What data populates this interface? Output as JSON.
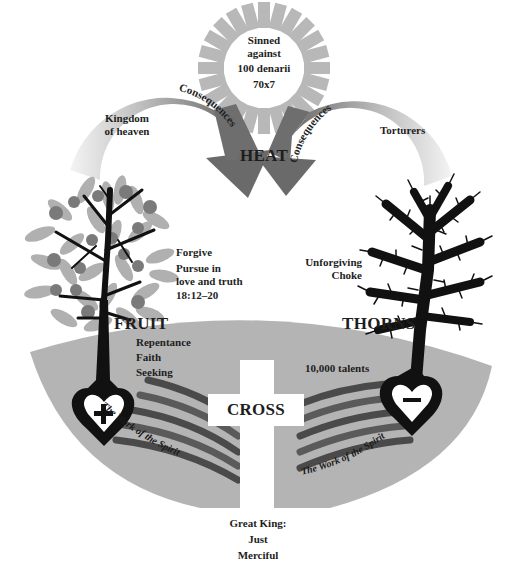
{
  "sun": {
    "lines": [
      "Sinned",
      "against",
      "100 denarii",
      "70x7"
    ],
    "label": "HEAT"
  },
  "left_arrow": {
    "curve_text": "Consequences",
    "inner_lines": [
      "Kingdom",
      "of heaven"
    ]
  },
  "right_arrow": {
    "curve_text": "Consequences",
    "inner_text": "Torturers"
  },
  "fruit_tree": {
    "label": "FRUIT",
    "side_lines": [
      "Forgive",
      "Pursue in",
      "love and truth",
      "18:12–20"
    ],
    "root_lines": [
      "Repentance",
      "Faith",
      "Seeking"
    ],
    "heart_symbol": "+"
  },
  "thorn_tree": {
    "label": "THORNS",
    "side_lines": [
      "Unforgiving",
      "Choke"
    ],
    "root_text": "10,000 talents",
    "heart_symbol": "–"
  },
  "cross": {
    "label": "CROSS"
  },
  "spirit": {
    "left_text": "The Work of the Spirit",
    "right_text": "The Work of the Spirit"
  },
  "king": {
    "lines": [
      "Great King:",
      "Just",
      "Merciful"
    ]
  },
  "colors": {
    "bowl": "#b4b4b4",
    "sun_rays": "#b8b8b8",
    "stripe_dark": "#4a4a4a",
    "stripe_mid": "#777777",
    "arrow_dark": "#6e6e6e",
    "arrow_light": "#e6e6e6",
    "leaf": "#b0b0b0",
    "fruit": "#7a7a7a",
    "ink": "#111111"
  }
}
